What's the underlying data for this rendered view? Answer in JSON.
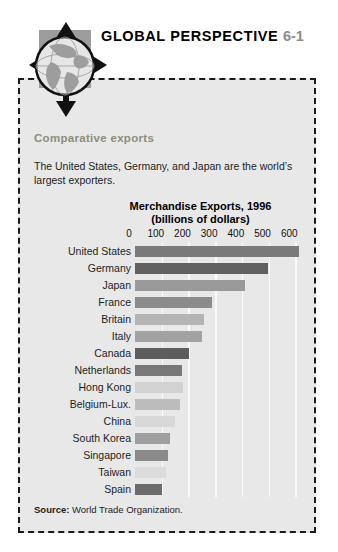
{
  "header": {
    "title": "GLOBAL PERSPECTIVE",
    "number": "6-1",
    "icon": "globe-with-four-arrows"
  },
  "panel": {
    "subhead": "Comparative exports",
    "blurb": "The United States, Germany, and Japan are the world’s largest exporters.",
    "source_label": "Source:",
    "source_text": "World Trade Organization."
  },
  "colors": {
    "panel_background": "#e8e8e8",
    "panel_border": "#1a1a1a",
    "subhead": "#8d8d7a",
    "number": "#8c8c8c",
    "gridline": "#fafafa"
  },
  "chart_data": {
    "type": "bar",
    "orientation": "horizontal",
    "title": "Merchandise Exports, 1996",
    "subtitle": "(billions of dollars)",
    "xlabel": "",
    "ylabel": "",
    "xlim": [
      0,
      640
    ],
    "ticks": [
      0,
      100,
      200,
      300,
      400,
      500,
      600
    ],
    "tick_labels": [
      "0",
      "100",
      "200",
      "300",
      "400",
      "500",
      "600"
    ],
    "grid": true,
    "legend": "none",
    "categories": [
      "United States",
      "Germany",
      "Japan",
      "France",
      "Britain",
      "Italy",
      "Canada",
      "Netherlands",
      "Hong Kong",
      "Belgium-Lux.",
      "China",
      "South Korea",
      "Singapore",
      "Taiwan",
      "Spain"
    ],
    "values": [
      612,
      498,
      412,
      288,
      260,
      251,
      202,
      177,
      181,
      170,
      151,
      130,
      125,
      116,
      102
    ],
    "bar_colors": [
      "#7a7a7a",
      "#606060",
      "#9a9a9a",
      "#8b8b8b",
      "#b4b4b4",
      "#a2a2a2",
      "#5d5d5d",
      "#787878",
      "#d2d2d2",
      "#bcbcbc",
      "#d8d8d8",
      "#9e9e9e",
      "#8a8a8a",
      "#dcdcdc",
      "#6b6b6b"
    ]
  }
}
